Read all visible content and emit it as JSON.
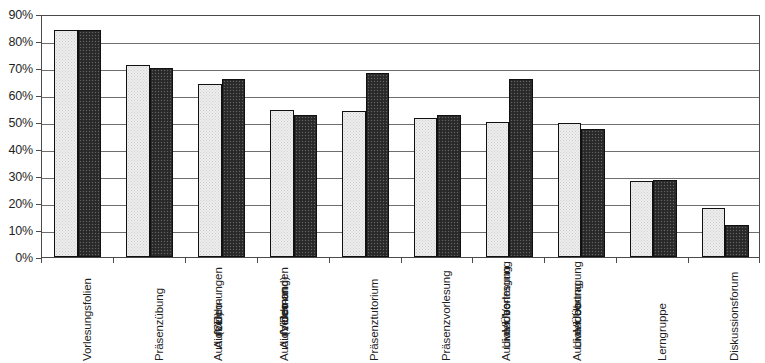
{
  "chart_data": {
    "type": "bar",
    "title": "",
    "subtitle": "",
    "xlabel": "",
    "ylabel": "",
    "ylim": [
      0,
      90
    ],
    "y_tick_labels": [
      "0%",
      "10%",
      "20%",
      "30%",
      "40%",
      "50%",
      "60%",
      "70%",
      "80%",
      "90%"
    ],
    "y_tick_values": [
      0,
      10,
      20,
      30,
      40,
      50,
      60,
      70,
      80,
      90
    ],
    "grid": true,
    "legend": "none",
    "categories": [
      "Vorlesungsfolien",
      "Präsenzübung",
      "AudioVideo-Aufzeichnungen (CD)",
      "AudioVideo-Aufzeichnungen (Video on Demand)",
      "Präsenztutorium",
      "Präsenzvorlesung",
      "AudioVideo-Live-Übertragung der Vorlesung",
      "AudioVideo-Live-Übertragung der Übung",
      "Lerngruppe",
      "Diskussionsforum"
    ],
    "category_lines": [
      [
        "Vorlesungsfolien"
      ],
      [
        "Präsenzübung"
      ],
      [
        "AudioVideo-",
        "Aufzeichnungen",
        "(CD)"
      ],
      [
        "AudioVideo-",
        "Aufzeichnungen",
        "(Video on",
        "Demand)"
      ],
      [
        "Präsenztutorium"
      ],
      [
        "Präsenzvorlesung"
      ],
      [
        "AudioVideo-",
        "Live-Übertragung",
        "der Vorlesung"
      ],
      [
        "AudioVideo-",
        "Live-Übertragung",
        "der Übung"
      ],
      [
        "Lerngruppe"
      ],
      [
        "Diskussionsforum"
      ]
    ],
    "series": [
      {
        "name": "series-a",
        "style": "light-dotted",
        "color": "#eeeeee",
        "values": [
          84,
          71,
          64,
          54.5,
          54,
          51.5,
          50,
          49.5,
          28,
          18
        ]
      },
      {
        "name": "series-b",
        "style": "dark-dithered",
        "color": "#2f2f2f",
        "values": [
          84,
          70,
          66,
          52.5,
          68,
          52.5,
          66,
          47.5,
          28.5,
          12
        ]
      }
    ]
  },
  "axis": {
    "y_unit": "%"
  }
}
